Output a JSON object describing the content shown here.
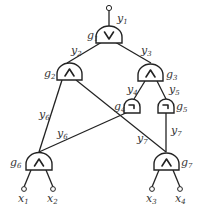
{
  "diagram": {
    "type": "boolean-circuit",
    "output": {
      "label": "y",
      "sub": "1"
    },
    "gates": [
      {
        "id": "g1",
        "label": "g",
        "sub": "1",
        "op": "∨",
        "op_name": "or"
      },
      {
        "id": "g2",
        "label": "g",
        "sub": "2",
        "op": "∧",
        "op_name": "and"
      },
      {
        "id": "g3",
        "label": "g",
        "sub": "3",
        "op": "∧",
        "op_name": "and"
      },
      {
        "id": "g4",
        "label": "g",
        "sub": "4",
        "op": "¬",
        "op_name": "not"
      },
      {
        "id": "g5",
        "label": "g",
        "sub": "5",
        "op": "¬",
        "op_name": "not"
      },
      {
        "id": "g6",
        "label": "g",
        "sub": "6",
        "op": "∧",
        "op_name": "and"
      },
      {
        "id": "g7",
        "label": "g",
        "sub": "7",
        "op": "∧",
        "op_name": "and"
      }
    ],
    "wire_labels": [
      {
        "label": "y",
        "sub": "2"
      },
      {
        "label": "y",
        "sub": "3"
      },
      {
        "label": "y",
        "sub": "4"
      },
      {
        "label": "y",
        "sub": "5"
      },
      {
        "label": "y",
        "sub": "6"
      },
      {
        "label": "y",
        "sub": "6"
      },
      {
        "label": "y",
        "sub": "7"
      },
      {
        "label": "y",
        "sub": "7"
      }
    ],
    "inputs": [
      {
        "label": "x",
        "sub": "1"
      },
      {
        "label": "x",
        "sub": "2"
      },
      {
        "label": "x",
        "sub": "3"
      },
      {
        "label": "x",
        "sub": "4"
      }
    ],
    "edges": [
      [
        "g2",
        "g1"
      ],
      [
        "g3",
        "g1"
      ],
      [
        "g6",
        "g2"
      ],
      [
        "g7",
        "g2"
      ],
      [
        "g4",
        "g3"
      ],
      [
        "g5",
        "g3"
      ],
      [
        "g6",
        "g4"
      ],
      [
        "g7",
        "g5"
      ],
      [
        "x1",
        "g6"
      ],
      [
        "x2",
        "g6"
      ],
      [
        "x3",
        "g7"
      ],
      [
        "x4",
        "g7"
      ]
    ]
  }
}
